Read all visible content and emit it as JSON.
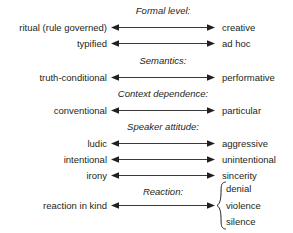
{
  "diagram": {
    "sections": [
      {
        "header": "Formal level:",
        "header_x": 163,
        "header_y": 5,
        "rows": [
          {
            "left": "ritual (rule governed)",
            "right": "creative",
            "y": 21
          },
          {
            "left": "typified",
            "right": "ad hoc",
            "y": 37
          }
        ]
      },
      {
        "header": "Semantics:",
        "header_x": 163,
        "header_y": 55,
        "rows": [
          {
            "left": "truth-conditional",
            "right": "performative",
            "y": 71
          }
        ]
      },
      {
        "header": "Context dependence:",
        "header_x": 163,
        "header_y": 88,
        "rows": [
          {
            "left": "conventional",
            "right": "particular",
            "y": 104
          }
        ]
      },
      {
        "header": "Speaker attitude:",
        "header_x": 163,
        "header_y": 121,
        "rows": [
          {
            "left": "ludic",
            "right": "aggressive",
            "y": 137
          },
          {
            "left": "intentional",
            "right": "unintentional",
            "y": 153
          },
          {
            "left": "irony",
            "right": "sincerity",
            "y": 169
          }
        ]
      },
      {
        "header": "Reaction:",
        "header_x": 163,
        "header_y": 186,
        "rows": [
          {
            "left": "reaction in kind",
            "right": "",
            "y": 199
          }
        ],
        "brace_options": [
          "denial",
          "violence",
          "silence"
        ]
      }
    ],
    "arrow_icon": "double-headed-arrow-icon",
    "brace_icon": "curly-brace-icon",
    "colors": {
      "text": "#231f20",
      "line": "#3a3a3a",
      "background": "#ffffff"
    }
  }
}
